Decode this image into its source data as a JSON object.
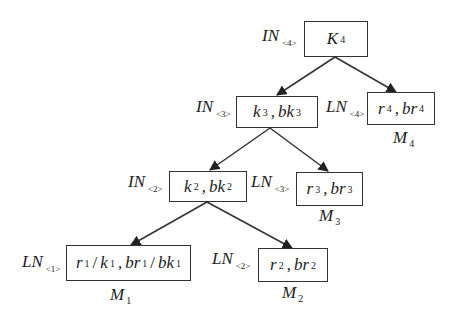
{
  "diagram": {
    "type": "tree",
    "nodes": [
      {
        "id": "root",
        "kind": "IN",
        "kind_index": "<4>",
        "content": [
          {
            "sym": "K",
            "sub": "4"
          }
        ],
        "memory": null
      },
      {
        "id": "in3",
        "kind": "IN",
        "kind_index": "<3>",
        "content": [
          {
            "sym": "k",
            "sub": "3"
          },
          {
            "sym": "bk",
            "sub": "3"
          }
        ],
        "memory": null
      },
      {
        "id": "ln4",
        "kind": "LN",
        "kind_index": "<4>",
        "content": [
          {
            "sym": "r",
            "sub": "4"
          },
          {
            "sym": "br",
            "sub": "4"
          }
        ],
        "memory": {
          "sym": "M",
          "sub": "4"
        }
      },
      {
        "id": "in2",
        "kind": "IN",
        "kind_index": "<2>",
        "content": [
          {
            "sym": "k",
            "sub": "2"
          },
          {
            "sym": "bk",
            "sub": "2"
          }
        ],
        "memory": null
      },
      {
        "id": "ln3",
        "kind": "LN",
        "kind_index": "<3>",
        "content": [
          {
            "sym": "r",
            "sub": "3"
          },
          {
            "sym": "br",
            "sub": "3"
          }
        ],
        "memory": {
          "sym": "M",
          "sub": "3"
        }
      },
      {
        "id": "ln1",
        "kind": "LN",
        "kind_index": "<1>",
        "content_text": "r1 / k1 , br1 / bk1",
        "memory": {
          "sym": "M",
          "sub": "1"
        }
      },
      {
        "id": "ln2",
        "kind": "LN",
        "kind_index": "<2>",
        "content": [
          {
            "sym": "r",
            "sub": "2"
          },
          {
            "sym": "br",
            "sub": "2"
          }
        ],
        "memory": {
          "sym": "M",
          "sub": "2"
        }
      }
    ],
    "edges": [
      {
        "from": "root",
        "to": "in3"
      },
      {
        "from": "root",
        "to": "ln4"
      },
      {
        "from": "in3",
        "to": "in2"
      },
      {
        "from": "in3",
        "to": "ln3"
      },
      {
        "from": "in2",
        "to": "ln1"
      },
      {
        "from": "in2",
        "to": "ln2"
      }
    ]
  },
  "labels": {
    "in4": {
      "name": "IN",
      "idx": "<4>"
    },
    "in3": {
      "name": "IN",
      "idx": "<3>"
    },
    "in2": {
      "name": "IN",
      "idx": "<2>"
    },
    "ln4": {
      "name": "LN",
      "idx": "<4>"
    },
    "ln3": {
      "name": "LN",
      "idx": "<3>"
    },
    "ln2": {
      "name": "LN",
      "idx": "<2>"
    },
    "ln1": {
      "name": "LN",
      "idx": "<1>"
    }
  },
  "boxes": {
    "root": {
      "a": "K",
      "a_sub": "4"
    },
    "in3": {
      "a": "k",
      "a_sub": "3",
      "sep": ",",
      "b": "bk",
      "b_sub": "3"
    },
    "ln4": {
      "a": "r",
      "a_sub": "4",
      "sep": ",",
      "b": "br",
      "b_sub": "4"
    },
    "in2": {
      "a": "k",
      "a_sub": "2",
      "sep": ",",
      "b": "bk",
      "b_sub": "2"
    },
    "ln3": {
      "a": "r",
      "a_sub": "3",
      "sep": ",",
      "b": "br",
      "b_sub": "3"
    },
    "ln1": {
      "a": "r",
      "a_sub": "1",
      "slash": "/",
      "a2": "k",
      "a2_sub": "1",
      "sep": ",",
      "b": "br",
      "b_sub": "1",
      "b2": "bk",
      "b2_sub": "1"
    },
    "ln2": {
      "a": "r",
      "a_sub": "2",
      "sep": ",",
      "b": "br",
      "b_sub": "2"
    }
  },
  "memories": {
    "m4": {
      "sym": "M",
      "sub": "4"
    },
    "m3": {
      "sym": "M",
      "sub": "3"
    },
    "m2": {
      "sym": "M",
      "sub": "2"
    },
    "m1": {
      "sym": "M",
      "sub": "1"
    }
  },
  "colors": {
    "line": "#333333",
    "text": "#222222",
    "background": "#ffffff"
  }
}
